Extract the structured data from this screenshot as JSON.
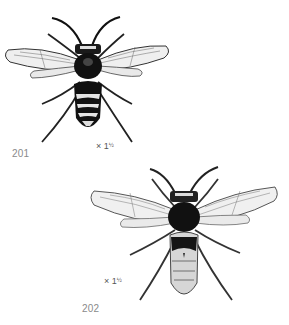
{
  "plate": {
    "figures": [
      {
        "number": "201",
        "scale_prefix": "× 1",
        "scale_fraction": "½",
        "subject": "wasp-dorsal-view-dark-banded"
      },
      {
        "number": "202",
        "scale_prefix": "× 1",
        "scale_fraction": "½",
        "subject": "wasp-dorsal-view-pale-abdomen"
      }
    ]
  },
  "colors": {
    "background": "#ffffff",
    "ink": "#111111",
    "wing_fill": "#efefef",
    "wing_vein": "#555555",
    "pale_band": "#d8d8d8",
    "label_text": "#8a8a8a"
  }
}
